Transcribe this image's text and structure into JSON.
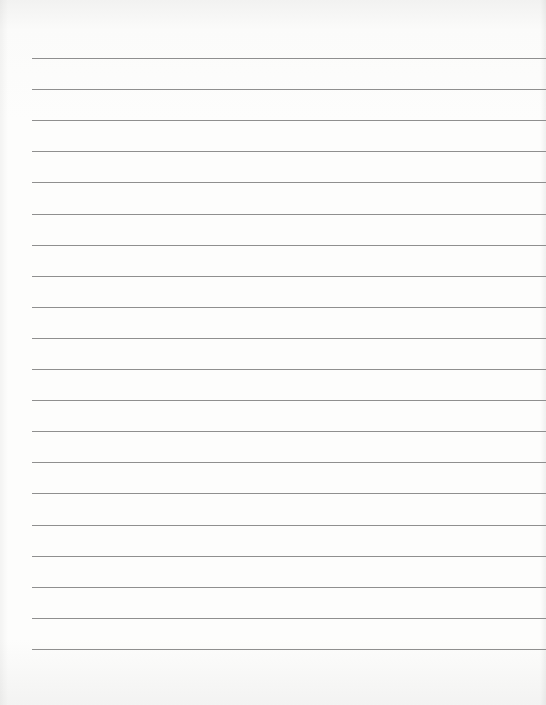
{
  "page": {
    "type": "blank lined paper",
    "line_count": 20,
    "first_line_y": 58,
    "line_spacing": 31.1,
    "line_left": 32,
    "line_color": "#8f8f8f",
    "paper_color": "#fdfdfc"
  }
}
